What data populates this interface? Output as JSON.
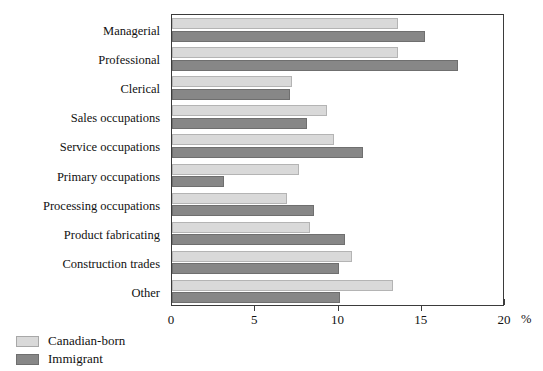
{
  "chart_data": {
    "type": "bar",
    "orientation": "horizontal",
    "title": "",
    "xlabel": "%",
    "ylabel": "",
    "xlim": [
      0,
      20
    ],
    "xticks": [
      0,
      5,
      10,
      15,
      20
    ],
    "xtick_labels": [
      "0",
      "5",
      "10",
      "15",
      "20"
    ],
    "grid": false,
    "legend_position": "bottom-left",
    "categories": [
      "Managerial",
      "Professional",
      "Clerical",
      "Sales occupations",
      "Service occupations",
      "Primary occupations",
      "Processing occupations",
      "Product fabricating",
      "Construction trades",
      "Other"
    ],
    "series": [
      {
        "name": "Canadian-born",
        "color": "#d9d9d9",
        "values": [
          13.6,
          13.6,
          7.2,
          9.3,
          9.7,
          7.6,
          6.9,
          8.3,
          10.8,
          13.3
        ]
      },
      {
        "name": "Immigrant",
        "color": "#878787",
        "values": [
          15.2,
          17.2,
          7.1,
          8.1,
          11.5,
          3.1,
          8.5,
          10.4,
          10.0,
          10.1
        ]
      }
    ]
  },
  "axis": {
    "unit_label": "%"
  },
  "legend": {
    "items": [
      {
        "label": "Canadian-born",
        "swatch": "light-gray-swatch"
      },
      {
        "label": "Immigrant",
        "swatch": "dark-gray-swatch"
      }
    ]
  }
}
